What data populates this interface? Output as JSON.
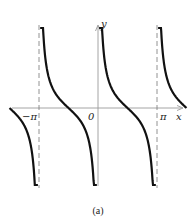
{
  "chart_data": {
    "type": "line",
    "title": "",
    "function": "y = cot x",
    "xlabel": "x",
    "ylabel": "y",
    "tick_labels": {
      "x": [
        "-π",
        "0",
        "π"
      ]
    },
    "x_ticks": [
      -3.14159,
      0,
      3.14159
    ],
    "xlim": [
      -4.7,
      4.7
    ],
    "ylim": [
      -4.5,
      4.5
    ],
    "asymptotes": [
      {
        "x": -3.14159,
        "style": "dashed"
      },
      {
        "x": 3.14159,
        "style": "dashed"
      }
    ],
    "series": [
      {
        "name": "cot x, branch (-3π/2 .. -π)",
        "x_range": [
          -4.71,
          -3.2
        ],
        "y_at_start": 0,
        "behavior": "decreasing to -∞"
      },
      {
        "name": "cot x, branch (-π .. 0)",
        "x_range": [
          -3.08,
          -0.06
        ],
        "y_at_mid": 0,
        "x_zero": -1.5708,
        "behavior": "+∞ to -∞"
      },
      {
        "name": "cot x, branch (0 .. π)",
        "x_range": [
          0.06,
          3.08
        ],
        "y_at_mid": 0,
        "x_zero": 1.5708,
        "behavior": "+∞ to -∞"
      },
      {
        "name": "cot x, branch (π .. 3π/2)",
        "x_range": [
          3.2,
          4.71
        ],
        "y_at_end": 0,
        "behavior": "+∞ decreasing to 0"
      }
    ],
    "grid": false,
    "legend": null
  },
  "labels": {
    "neg_pi": "−π",
    "zero": "0",
    "pi": "π",
    "x_axis": "x",
    "y_axis": "y"
  },
  "caption": "(a)",
  "colors": {
    "curve": "#111111",
    "axes": "#9a9a9a",
    "asymptote": "#777777"
  }
}
